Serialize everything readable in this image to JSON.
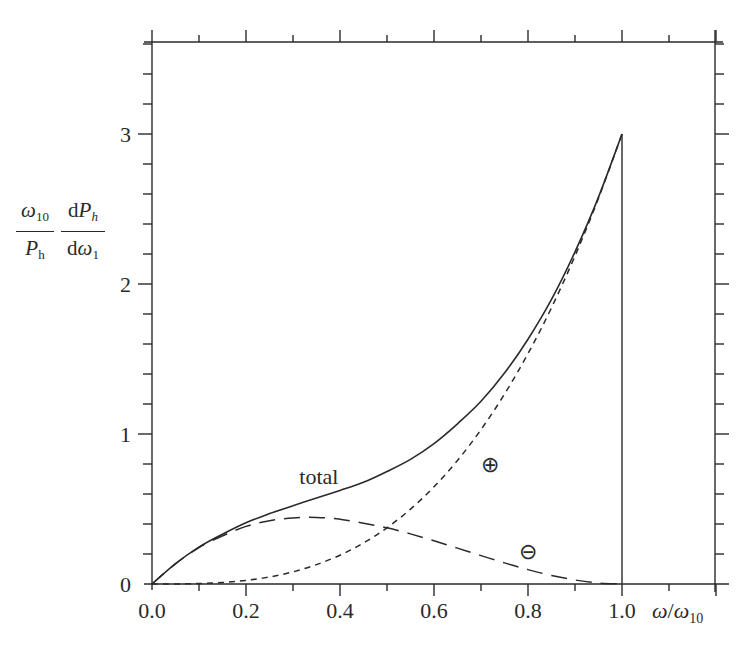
{
  "chart_data": {
    "type": "line",
    "title": "",
    "xlabel": "ω/ω10",
    "ylabel": "(ω10 / Ph) (dPh / dω1)",
    "xlim": [
      0.0,
      1.2
    ],
    "ylim": [
      0.0,
      3.6
    ],
    "x_ticks": [
      "0.0",
      "0.2",
      "0.4",
      "0.6",
      "0.8",
      "1.0"
    ],
    "y_ticks": [
      "0",
      "1",
      "2",
      "3"
    ],
    "x_minor_step": 0.1,
    "y_minor_step": 0.2,
    "grid": false,
    "legend": "none (inline labels)",
    "x": [
      0.0,
      0.05,
      0.1,
      0.15,
      0.2,
      0.25,
      0.3,
      0.35,
      0.4,
      0.45,
      0.5,
      0.55,
      0.6,
      0.65,
      0.7,
      0.75,
      0.8,
      0.85,
      0.9,
      0.95,
      1.0
    ],
    "series": [
      {
        "name": "total",
        "style": "solid",
        "values": [
          0.0,
          0.136,
          0.246,
          0.332,
          0.408,
          0.469,
          0.522,
          0.573,
          0.624,
          0.678,
          0.75,
          0.831,
          0.936,
          1.068,
          1.218,
          1.406,
          1.632,
          1.897,
          2.214,
          2.579,
          3.0
        ]
      },
      {
        "name": "⊕ (positive helicity)",
        "style": "short-dash",
        "values": [
          0.0,
          0.0004,
          0.003,
          0.01,
          0.024,
          0.047,
          0.081,
          0.129,
          0.192,
          0.273,
          0.375,
          0.499,
          0.648,
          0.824,
          1.029,
          1.266,
          1.536,
          1.842,
          2.187,
          2.572,
          3.0
        ]
      },
      {
        "name": "⊖ (negative helicity)",
        "style": "long-dash",
        "values": [
          0.0,
          0.135,
          0.243,
          0.321,
          0.384,
          0.422,
          0.441,
          0.444,
          0.432,
          0.405,
          0.375,
          0.334,
          0.288,
          0.239,
          0.189,
          0.141,
          0.096,
          0.057,
          0.027,
          0.007,
          0.0
        ]
      }
    ],
    "annotations": [
      {
        "text": "total",
        "x": 0.355,
        "y": 0.72
      },
      {
        "text": "⊕",
        "x": 0.72,
        "y": 0.8
      },
      {
        "text": "⊖",
        "x": 0.8,
        "y": 0.22
      }
    ],
    "vertical_drop": {
      "x": 1.0,
      "from": 3.0,
      "to": 0.0
    }
  },
  "axis": {
    "x_label_omega": "ω",
    "x_label_slash": "/",
    "x_label_omega10": "ω",
    "x_label_sub": "10"
  },
  "ylabel": {
    "frac1_num_sym": "ω",
    "frac1_num_sub": "10",
    "frac1_den_sym": "P",
    "frac1_den_sub": "h",
    "frac2_num_d": "d",
    "frac2_num_sym": "P",
    "frac2_num_sub": "h",
    "frac2_den_d": "d",
    "frac2_den_sym": "ω",
    "frac2_den_sub": "1"
  },
  "style": {
    "ink": "#2a2a2a",
    "background": "#ffffff"
  }
}
